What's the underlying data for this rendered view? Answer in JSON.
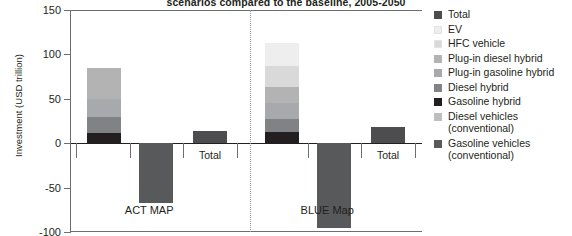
{
  "chart_data": {
    "type": "bar",
    "subtype": "grouped-stacked-waterfall",
    "title": "scenarios compared to the baseline, 2005-2050",
    "xlabel": "",
    "ylabel": "Investment (USD trillion)",
    "ylim": [
      -100,
      150
    ],
    "yticks": [
      150,
      100,
      50,
      0,
      -50,
      -100
    ],
    "grid": false,
    "legend_position": "right",
    "categories": [
      "ACT MAP",
      "BLUE Map"
    ],
    "legend": [
      "Total",
      "EV",
      "HFC vehicle",
      "Plug-in diesel hybrid",
      "Plug-in gasoline hybrid",
      "Diesel hybrid",
      "Gasoline hybrid",
      "Diesel vehicles (conventional)",
      "Gasoline vehicles (conventional)"
    ],
    "colors": {
      "Total": "#4d4d4f",
      "EV": "#eeeeee",
      "HFC vehicle": "#d9d9d9",
      "Plug-in diesel hybrid": "#b3b3b3",
      "Plug-in gasoline hybrid": "#a7a9ac",
      "Diesel hybrid": "#808285",
      "Gasoline hybrid": "#231f20",
      "Diesel vehicles (conventional)": "#bcbec0",
      "Gasoline vehicles (conventional)": "#58595b"
    },
    "groups": [
      {
        "name": "ACT MAP",
        "bars": [
          {
            "name": "positive-stack",
            "label": "",
            "stacked": true,
            "segments": [
              {
                "name": "Gasoline hybrid",
                "value": 12
              },
              {
                "name": "Diesel hybrid",
                "value": 17
              },
              {
                "name": "Plug-in gasoline hybrid",
                "value": 21
              },
              {
                "name": "Plug-in diesel hybrid",
                "value": 35
              }
            ],
            "total": 85
          },
          {
            "name": "negative-stack",
            "label": "",
            "stacked": true,
            "segments": [
              {
                "name": "Gasoline vehicles (conventional)",
                "value": -67
              }
            ],
            "total": -67
          },
          {
            "name": "net-total",
            "label": "Total",
            "stacked": false,
            "segments": [
              {
                "name": "Total",
                "value": 14
              }
            ],
            "total": 14
          }
        ]
      },
      {
        "name": "BLUE Map",
        "bars": [
          {
            "name": "positive-stack",
            "label": "",
            "stacked": true,
            "segments": [
              {
                "name": "Gasoline hybrid",
                "value": 13
              },
              {
                "name": "Diesel hybrid",
                "value": 14
              },
              {
                "name": "Plug-in gasoline hybrid",
                "value": 18
              },
              {
                "name": "Plug-in diesel hybrid",
                "value": 18
              },
              {
                "name": "HFC vehicle",
                "value": 24
              },
              {
                "name": "EV",
                "value": 26
              }
            ],
            "total": 113
          },
          {
            "name": "negative-stack",
            "label": "",
            "stacked": true,
            "segments": [
              {
                "name": "Gasoline vehicles (conventional)",
                "value": -95
              }
            ],
            "total": -95
          },
          {
            "name": "net-total",
            "label": "Total",
            "stacked": false,
            "segments": [
              {
                "name": "Total",
                "value": 18
              }
            ],
            "total": 18
          }
        ]
      }
    ]
  },
  "axis": {
    "y_title": "Investment (USD trillion)",
    "tick_labels": [
      "150",
      "100",
      "50",
      "0",
      "-50",
      "-100"
    ]
  },
  "labels": {
    "group1": "ACT MAP",
    "group2": "BLUE Map",
    "total1": "Total",
    "total2": "Total"
  },
  "legend": {
    "items": [
      {
        "label": "Total",
        "color": "#4d4d4f"
      },
      {
        "label": "EV",
        "color": "#eeeeee"
      },
      {
        "label": "HFC vehicle",
        "color": "#d9d9d9"
      },
      {
        "label": "Plug-in diesel hybrid",
        "color": "#b3b3b3"
      },
      {
        "label": "Plug-in gasoline hybrid",
        "color": "#a7a9ac"
      },
      {
        "label": "Diesel hybrid",
        "color": "#808285"
      },
      {
        "label": "Gasoline hybrid",
        "color": "#231f20"
      },
      {
        "label": "Diesel vehicles\n(conventional)",
        "color": "#bcbec0"
      },
      {
        "label": "Gasoline vehicles\n(conventional)",
        "color": "#58595b"
      }
    ]
  },
  "title": {
    "text": "scenarios compared to the baseline, 2005-2050"
  }
}
